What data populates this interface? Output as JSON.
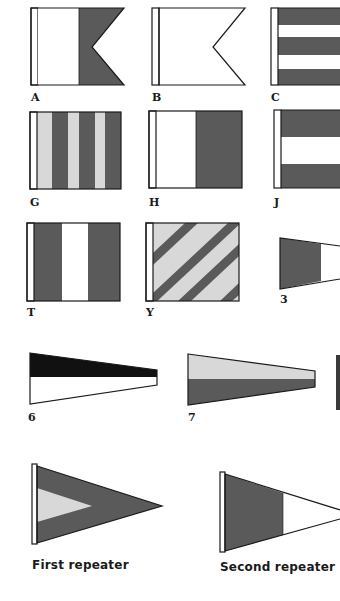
{
  "colors": {
    "dark": "#5a5a5a",
    "light": "#d8d8d8",
    "white": "#ffffff",
    "black": "#111111",
    "outline": "#1a1a1a"
  },
  "flags": [
    {
      "id": "A",
      "label": "A",
      "pattern": "white-dark swallowtail"
    },
    {
      "id": "B",
      "label": "B",
      "pattern": "dark swallowtail"
    },
    {
      "id": "C",
      "label": "C",
      "pattern": "horizontal stripes dark-white-dark-white-dark"
    },
    {
      "id": "G",
      "label": "G",
      "pattern": "vertical stripes light-dark alternating"
    },
    {
      "id": "H",
      "label": "H",
      "pattern": "vertical halves white-dark"
    },
    {
      "id": "J",
      "label": "J",
      "pattern": "horizontal stripes dark-white-dark"
    },
    {
      "id": "T",
      "label": "T",
      "pattern": "vertical stripes dark-white-dark"
    },
    {
      "id": "Y",
      "label": "Y",
      "pattern": "diagonal stripes dark-light"
    },
    {
      "id": "3",
      "label": "3",
      "pattern": "pennant dark-white"
    },
    {
      "id": "6",
      "label": "6",
      "pattern": "pennant black over white"
    },
    {
      "id": "7",
      "label": "7",
      "pattern": "pennant light over dark"
    },
    {
      "id": "first-repeater",
      "label": "First repeater",
      "pattern": "triangle dark with light inner triangle"
    },
    {
      "id": "second-repeater",
      "label": "Second repeater",
      "pattern": "triangle dark hoist, white fly"
    }
  ]
}
